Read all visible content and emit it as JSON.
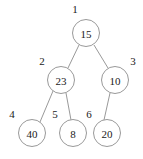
{
  "diagram": {
    "type": "binary-tree",
    "background_color": "#ffffff",
    "stroke_color": "#8d8d8d",
    "text_color": "#1a1a1a",
    "nodes": [
      {
        "index": "1",
        "value": "15",
        "cx": 86,
        "cy": 33,
        "r": 13.5,
        "index_x": 75,
        "index_y": 9
      },
      {
        "index": "2",
        "value": "23",
        "cx": 61,
        "cy": 80,
        "r": 13.5,
        "index_x": 42,
        "index_y": 61
      },
      {
        "index": "3",
        "value": "10",
        "cx": 115,
        "cy": 80,
        "r": 13.5,
        "index_x": 133,
        "index_y": 61
      },
      {
        "index": "4",
        "value": "40",
        "cx": 32,
        "cy": 133,
        "r": 13.5,
        "index_x": 12,
        "index_y": 114
      },
      {
        "index": "5",
        "value": "8",
        "cx": 73,
        "cy": 133,
        "r": 13.5,
        "index_x": 55,
        "index_y": 114
      },
      {
        "index": "6",
        "value": "20",
        "cx": 107,
        "cy": 133,
        "r": 13.5,
        "index_x": 89,
        "index_y": 114
      }
    ],
    "edges": [
      {
        "from": "1",
        "to": "2",
        "x1": 79,
        "y1": 45,
        "x2": 68,
        "y2": 68
      },
      {
        "from": "1",
        "to": "3",
        "x1": 94,
        "y1": 45,
        "x2": 108,
        "y2": 68
      },
      {
        "from": "2",
        "to": "4",
        "x1": 53,
        "y1": 91,
        "x2": 40,
        "y2": 122
      },
      {
        "from": "2",
        "to": "5",
        "x1": 66,
        "y1": 93,
        "x2": 71,
        "y2": 120
      },
      {
        "from": "3",
        "to": "6",
        "x1": 110,
        "y1": 93,
        "x2": 104,
        "y2": 120
      }
    ]
  }
}
